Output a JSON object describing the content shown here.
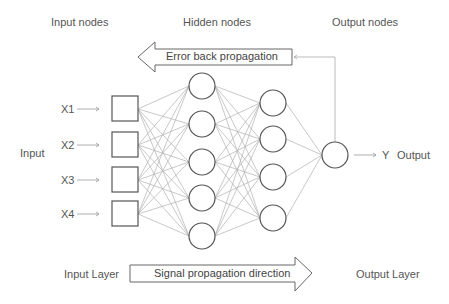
{
  "headers": {
    "input_nodes": "Input nodes",
    "hidden_nodes": "Hidden nodes",
    "output_nodes": "Output nodes"
  },
  "error_arrow": {
    "label": "Error back propagation"
  },
  "signal_arrow": {
    "label": "Signal propagation direction"
  },
  "inputs": [
    {
      "label": "X1"
    },
    {
      "label": "X2"
    },
    {
      "label": "X3"
    },
    {
      "label": "X4"
    }
  ],
  "side_labels": {
    "input": "Input",
    "output_var": "Y",
    "output": "Output"
  },
  "footer": {
    "input_layer": "Input Layer",
    "output_layer": "Output Layer"
  },
  "network": {
    "input_nodes": 4,
    "hidden_layer_1_nodes": 5,
    "hidden_layer_2_nodes": 4,
    "output_nodes": 1
  },
  "colors": {
    "node_stroke": "#555555",
    "edge": "#b0b0b0",
    "text": "#555555",
    "arrow_stroke": "#666666"
  }
}
